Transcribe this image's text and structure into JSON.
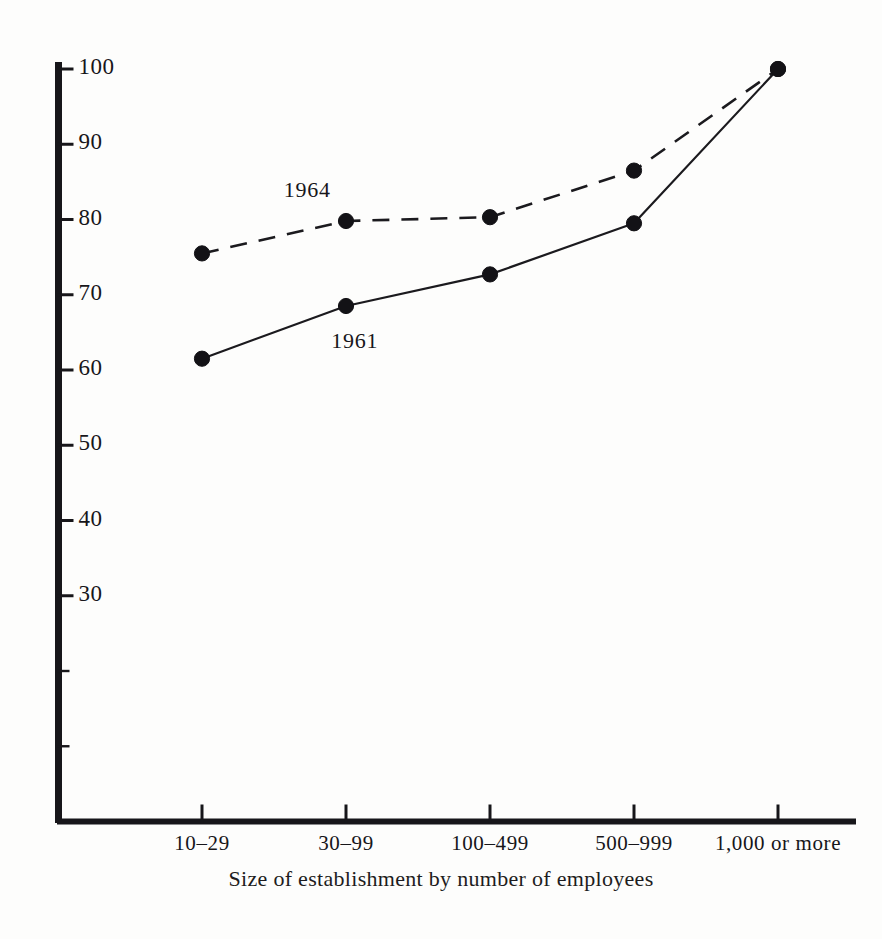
{
  "chart_data": {
    "type": "line",
    "title": "",
    "subtitle": "",
    "xlabel": "Size of establishment  by  number  of employees",
    "ylabel": "",
    "categories": [
      "10–29",
      "30–99",
      "100–499",
      "500–999",
      "1,000 or more"
    ],
    "series": [
      {
        "name": "1964",
        "style": "dashed",
        "values": [
          75.5,
          79.8,
          80.3,
          86.5,
          100
        ]
      },
      {
        "name": "1961",
        "style": "solid",
        "values": [
          61.5,
          68.5,
          72.7,
          79.5,
          100
        ]
      }
    ],
    "ylim": [
      0,
      100
    ],
    "yticks": [
      0,
      10,
      20,
      30,
      40,
      50,
      60,
      70,
      80,
      90,
      100
    ],
    "ytick_labels": [
      "",
      "",
      "",
      "30",
      "40",
      "50",
      "60",
      "70",
      "80",
      "90",
      "100"
    ],
    "grid": false,
    "legend_position": "inline-annotations",
    "annotations": [
      {
        "text": "1964",
        "value_x": 0.72,
        "value_y": 83.5
      },
      {
        "text": "1961",
        "value_x": 1.05,
        "value_y": 63.5
      }
    ],
    "colors": {
      "ink": "#17161a",
      "background": "#fdfdfc"
    }
  }
}
